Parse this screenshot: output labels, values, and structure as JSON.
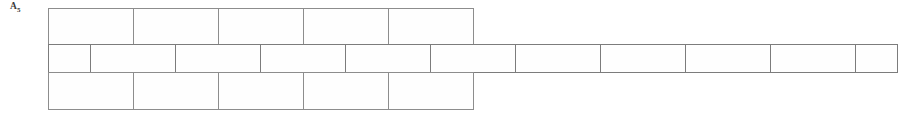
{
  "figure": {
    "label_main": "A",
    "label_subscript": "5",
    "label_full": "A5"
  },
  "diagram": {
    "type": "running-bond-brick-pattern",
    "line_color": "#8a8a8a",
    "brick_fill": "#fefefe",
    "background": "#ffffff",
    "courses": [
      {
        "name": "top-course",
        "bricks": [
          {
            "size": "full"
          },
          {
            "size": "full"
          },
          {
            "size": "full"
          },
          {
            "size": "full"
          },
          {
            "size": "full"
          }
        ]
      },
      {
        "name": "middle-course",
        "bricks": [
          {
            "size": "half"
          },
          {
            "size": "full"
          },
          {
            "size": "full"
          },
          {
            "size": "full"
          },
          {
            "size": "full"
          },
          {
            "size": "full"
          },
          {
            "size": "full"
          },
          {
            "size": "full"
          },
          {
            "size": "full"
          },
          {
            "size": "full"
          },
          {
            "size": "half"
          }
        ]
      },
      {
        "name": "bottom-course",
        "bricks": [
          {
            "size": "full"
          },
          {
            "size": "full"
          },
          {
            "size": "full"
          },
          {
            "size": "full"
          },
          {
            "size": "full"
          }
        ]
      }
    ]
  }
}
